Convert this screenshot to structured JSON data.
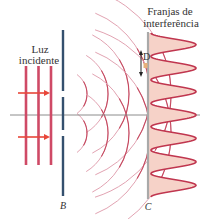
{
  "labels": {
    "incident_line1": "Luz",
    "incident_line2": "incidente",
    "fringes_line1": "Franjas de",
    "fringes_line2": "interferência",
    "barrier": "B",
    "screen": "C",
    "distance": "D"
  },
  "colors": {
    "wave": "#c0364f",
    "wave_faint": "#e2a3b2",
    "incident": "#cf4a66",
    "arrow": "#e8473a",
    "barrier": "#34506e",
    "screen": "#a9a9a9",
    "axis": "#8c8c8c",
    "fringe_fill": "#f6d2c8",
    "marker": "#e7b07a"
  },
  "diagram": {
    "incident_wavefront_count": 3,
    "slit_count": 2,
    "interference_peak_count": 7,
    "wave_arc_count": 5
  }
}
